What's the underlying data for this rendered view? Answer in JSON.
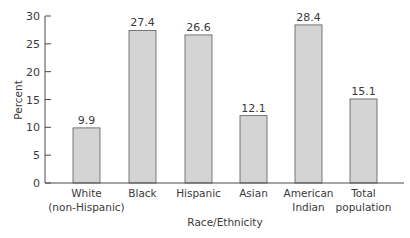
{
  "chart_data": {
    "type": "bar",
    "title": "",
    "xlabel": "Race/Ethnicity",
    "ylabel": "Percent",
    "ylim": [
      0,
      30
    ],
    "yticks": [
      0,
      5,
      10,
      15,
      20,
      25,
      30
    ],
    "grid": false,
    "legend": null,
    "categories": [
      [
        "White",
        "(non-Hispanic)"
      ],
      [
        "Black"
      ],
      [
        "Hispanic"
      ],
      [
        "Asian"
      ],
      [
        "American",
        "Indian"
      ],
      [
        "Total",
        "population"
      ]
    ],
    "values": [
      9.9,
      27.4,
      26.6,
      12.1,
      28.4,
      15.1
    ],
    "value_labels": [
      "9.9",
      "27.4",
      "26.6",
      "12.1",
      "28.4",
      "15.1"
    ],
    "colors": {
      "bar_fill": "#d4d4d4",
      "bar_stroke": "#5a5a5a",
      "axis": "#4a4a4a",
      "text": "#3a3a3a"
    }
  }
}
